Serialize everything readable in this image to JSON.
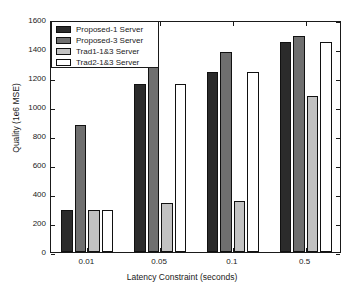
{
  "chart_data": {
    "type": "bar",
    "title": "",
    "xlabel": "Latency Constraint (seconds)",
    "ylabel": "Quality (1e6 MSE)",
    "categories": [
      "0.01",
      "0.05",
      "0.1",
      "0.5"
    ],
    "ylim": [
      0,
      1600
    ],
    "yticks": [
      "0",
      "200",
      "400",
      "600",
      "800",
      "1000",
      "1200",
      "1400",
      "1600"
    ],
    "ytick_values": [
      0,
      200,
      400,
      600,
      800,
      1000,
      1200,
      1400,
      1600
    ],
    "grid": false,
    "legend_position": "upper left",
    "series": [
      {
        "name": "Proposed-1 Server",
        "color": "#2b2b2b",
        "values": [
          290,
          1160,
          1240,
          1450
        ]
      },
      {
        "name": "Proposed-3 Server",
        "color": "#6f6f6f",
        "values": [
          875,
          1285,
          1380,
          1490
        ]
      },
      {
        "name": "Trad1-1&3 Server",
        "color": "#c2c2c2",
        "values": [
          290,
          335,
          355,
          1075
        ]
      },
      {
        "name": "Trad2-1&3 Server",
        "color": "#ffffff",
        "values": [
          290,
          1160,
          1240,
          1450
        ]
      }
    ]
  }
}
